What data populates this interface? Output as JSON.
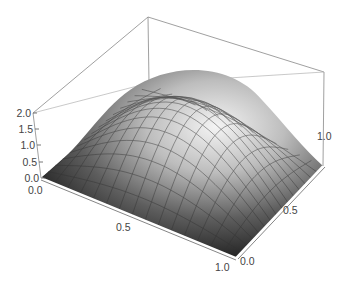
{
  "chart_data": {
    "type": "surface3d",
    "title": "",
    "function_description": "Dome-shaped surface z(x,y) over the unit square, zero on the boundary, peaking at center (0.5,0.5) with z ≈ 1.0 (plotted z-range up to 2.0)",
    "x_range": [
      0.0,
      1.0
    ],
    "y_range": [
      0.0,
      1.0
    ],
    "z_range": [
      0.0,
      2.0
    ],
    "x_ticks": [
      "0.0",
      "0.5",
      "1.0"
    ],
    "y_ticks": [
      "0.0",
      "0.5",
      "1.0"
    ],
    "z_ticks": [
      "0.0",
      "0.5",
      "1.0",
      "1.5",
      "2.0"
    ],
    "grid_mesh": "approx 15x15 mesh lines on surface",
    "shading": "grayscale, light from upper right",
    "bounding_box": true,
    "xlabel": "",
    "ylabel": "",
    "zlabel": ""
  },
  "labels": {
    "z": [
      "0.0",
      "0.5",
      "1.0",
      "1.5",
      "2.0"
    ],
    "x": [
      "0.0",
      "0.5",
      "1.0"
    ],
    "y": [
      "0.0",
      "0.5",
      "1.0"
    ]
  }
}
